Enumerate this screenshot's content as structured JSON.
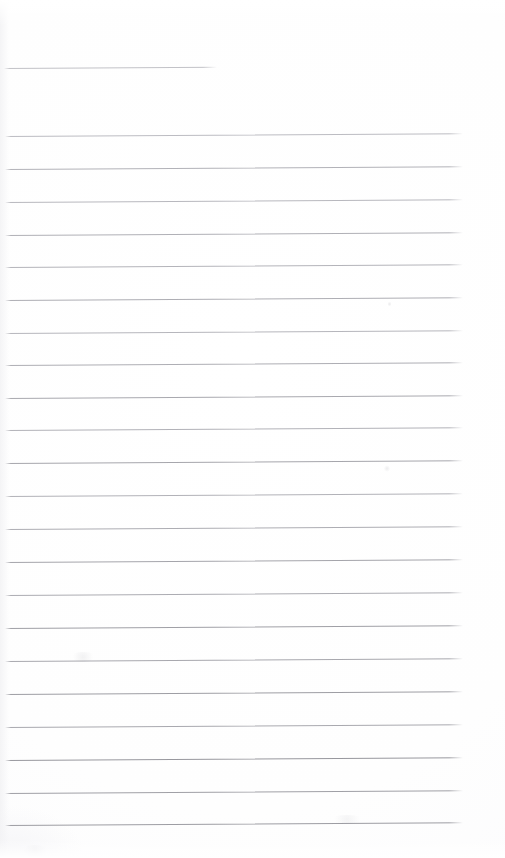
{
  "document": {
    "kind": "scanned-lined-paper",
    "title": "",
    "visible_text": "",
    "width": 505,
    "height": 858,
    "background_color": "#ffffff",
    "rule_color": "#a9a9ae",
    "rule_color_light": "#c4c4c9",
    "rule_color_dark": "#97979d",
    "notes": "Blank ruled writing paper scan; no text, headings or handwriting present."
  },
  "ruling": {
    "line_count": 24,
    "spacing_px": 32.7,
    "left_margin_px": 5,
    "right_end_px": 463,
    "skew_deg": -0.33,
    "short_first_line_end_px": 217,
    "lines": [
      {
        "id": "rule-01",
        "y": 68,
        "x_start": 4,
        "x_end": 217,
        "weight": 1,
        "color": "#c2c2c7",
        "partial": true
      },
      {
        "id": "rule-02",
        "y": 136,
        "x_start": 5,
        "x_end": 463,
        "weight": 1,
        "color": "#bcbcc2",
        "partial": false
      },
      {
        "id": "rule-03",
        "y": 169,
        "x_start": 5,
        "x_end": 463,
        "weight": 1,
        "color": "#b2b2b8",
        "partial": false
      },
      {
        "id": "rule-04",
        "y": 202,
        "x_start": 5,
        "x_end": 463,
        "weight": 1,
        "color": "#b8b8be",
        "partial": false
      },
      {
        "id": "rule-05",
        "y": 235,
        "x_start": 5,
        "x_end": 463,
        "weight": 1,
        "color": "#b0b0b6",
        "partial": false
      },
      {
        "id": "rule-06",
        "y": 267,
        "x_start": 5,
        "x_end": 463,
        "weight": 1,
        "color": "#b4b4ba",
        "partial": false
      },
      {
        "id": "rule-07",
        "y": 300,
        "x_start": 5,
        "x_end": 463,
        "weight": 1,
        "color": "#aeaeb4",
        "partial": false
      },
      {
        "id": "rule-08",
        "y": 333,
        "x_start": 5,
        "x_end": 463,
        "weight": 1,
        "color": "#b6b6bc",
        "partial": false
      },
      {
        "id": "rule-09",
        "y": 365,
        "x_start": 5,
        "x_end": 463,
        "weight": 1,
        "color": "#aeaeb4",
        "partial": false
      },
      {
        "id": "rule-10",
        "y": 398,
        "x_start": 5,
        "x_end": 463,
        "weight": 1,
        "color": "#a9a9af",
        "partial": false
      },
      {
        "id": "rule-11",
        "y": 430,
        "x_start": 5,
        "x_end": 463,
        "weight": 1,
        "color": "#b2b2b8",
        "partial": false
      },
      {
        "id": "rule-12",
        "y": 463,
        "x_start": 5,
        "x_end": 463,
        "weight": 1,
        "color": "#a6a6ac",
        "partial": false
      },
      {
        "id": "rule-13",
        "y": 496,
        "x_start": 5,
        "x_end": 463,
        "weight": 1,
        "color": "#b2b2b8",
        "partial": false
      },
      {
        "id": "rule-14",
        "y": 529,
        "x_start": 5,
        "x_end": 463,
        "weight": 1,
        "color": "#adadb3",
        "partial": false
      },
      {
        "id": "rule-15",
        "y": 562,
        "x_start": 5,
        "x_end": 463,
        "weight": 1,
        "color": "#a5a5ab",
        "partial": false
      },
      {
        "id": "rule-16",
        "y": 595,
        "x_start": 5,
        "x_end": 463,
        "weight": 1,
        "color": "#acacb2",
        "partial": false
      },
      {
        "id": "rule-17",
        "y": 628,
        "x_start": 5,
        "x_end": 463,
        "weight": 1.1,
        "color": "#a0a0a6",
        "partial": false
      },
      {
        "id": "rule-18",
        "y": 661,
        "x_start": 5,
        "x_end": 463,
        "weight": 1,
        "color": "#a8a8ae",
        "partial": false
      },
      {
        "id": "rule-19",
        "y": 694,
        "x_start": 5,
        "x_end": 463,
        "weight": 1.1,
        "color": "#9e9ea4",
        "partial": false
      },
      {
        "id": "rule-20",
        "y": 727,
        "x_start": 5,
        "x_end": 463,
        "weight": 1,
        "color": "#a9a9af",
        "partial": false
      },
      {
        "id": "rule-21",
        "y": 760,
        "x_start": 5,
        "x_end": 463,
        "weight": 1.2,
        "color": "#98989e",
        "partial": false
      },
      {
        "id": "rule-22",
        "y": 793,
        "x_start": 5,
        "x_end": 463,
        "weight": 1.1,
        "color": "#a0a0a6",
        "partial": false
      },
      {
        "id": "rule-23",
        "y": 825,
        "x_start": 5,
        "x_end": 463,
        "weight": 1.1,
        "color": "#9d9da3",
        "partial": false
      }
    ]
  },
  "artifacts": {
    "description": "Faint scanner smudges and pencil ticks on otherwise blank paper.",
    "marks": [
      {
        "id": "mark-tick-upper",
        "x": 388,
        "y": 301,
        "w": 3,
        "h": 6,
        "opacity": 0.16
      },
      {
        "id": "mark-tick-middle",
        "x": 384,
        "y": 465,
        "w": 6,
        "h": 7,
        "opacity": 0.14
      },
      {
        "id": "mark-smudge-left",
        "x": 70,
        "y": 652,
        "w": 26,
        "h": 10,
        "opacity": 0.1
      },
      {
        "id": "mark-smudge-lower",
        "x": 330,
        "y": 815,
        "w": 34,
        "h": 9,
        "opacity": 0.08
      },
      {
        "id": "mark-smudge-bottom-left",
        "x": 20,
        "y": 845,
        "w": 30,
        "h": 12,
        "opacity": 0.07
      }
    ]
  }
}
